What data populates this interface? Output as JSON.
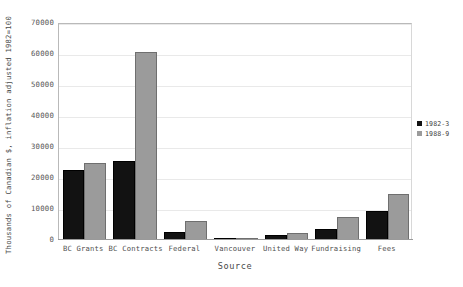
{
  "chart_data": {
    "type": "bar",
    "title": "",
    "xlabel": "Source",
    "ylabel": "Thousands of Canadian $, inflation adjusted 1982=100",
    "categories": [
      "BC Grants",
      "BC Contracts",
      "Federal",
      "Vancouver",
      "United Way",
      "Fundraising",
      "Fees"
    ],
    "series": [
      {
        "name": "1982-3",
        "color": "#121212",
        "values": [
          22500,
          25500,
          2500,
          500,
          1500,
          3500,
          9500
        ]
      },
      {
        "name": "1988-9",
        "color": "#9b9b9b",
        "values": [
          24800,
          60500,
          6000,
          800,
          2200,
          7500,
          15000
        ]
      }
    ],
    "ylim": [
      0,
      70000
    ],
    "ytick_labels": [
      "70000",
      "60000",
      "50000",
      "40000",
      "30000",
      "20000",
      "10000",
      "0"
    ],
    "ytick_values": [
      70000,
      60000,
      50000,
      40000,
      30000,
      20000,
      10000,
      0
    ],
    "grid": true,
    "legend_position": "right"
  }
}
